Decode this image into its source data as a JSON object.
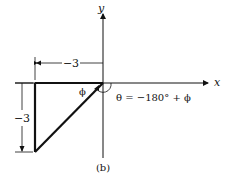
{
  "figure": {
    "caption": "(b)",
    "axes": {
      "x_label": "x",
      "y_label": "y"
    },
    "dimensions": {
      "horizontal": "−3",
      "vertical": "−3"
    },
    "angle_label": "ϕ",
    "equation": "θ = −180° + ϕ"
  }
}
